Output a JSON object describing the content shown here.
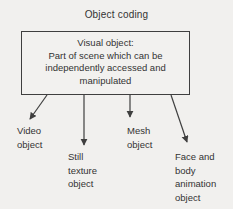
{
  "diagram": {
    "title": "Object coding",
    "box": {
      "text": "Visual object:\nPart of scene which can be\nindependently accessed and\nmanipulated"
    },
    "leaves": [
      {
        "id": "video-object",
        "label": "Video\nobject"
      },
      {
        "id": "still-texture-object",
        "label": "Still\ntexture\nobject"
      },
      {
        "id": "mesh-object",
        "label": "Mesh\nobject"
      },
      {
        "id": "face-body-animation-object",
        "label": "Face and\nbody\nanimation\nobject"
      }
    ],
    "colors": {
      "background": "#f1f0ee",
      "line": "#3f3f3f",
      "text": "#333333"
    }
  }
}
